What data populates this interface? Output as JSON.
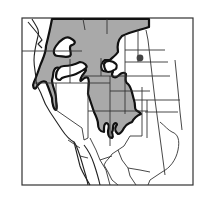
{
  "map": {
    "type": "species range map",
    "region": "Western North America",
    "colors": {
      "range_fill": "#a9a9a9",
      "range_outline": "#111111",
      "border": "#333333",
      "background": "#ffffff",
      "point_marker": "#444444"
    },
    "legend": [],
    "features": [
      {
        "name": "main-range",
        "description": "shaded continuous range across interior West"
      },
      {
        "name": "isolated-point",
        "description": "single outlying record dot in northern plains"
      }
    ]
  }
}
